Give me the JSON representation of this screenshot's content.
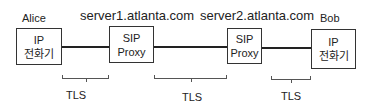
{
  "diagram": {
    "nodes": [
      {
        "id": "alice",
        "caption": "Alice",
        "line1": "IP",
        "line2": "전화기"
      },
      {
        "id": "proxy1",
        "caption": "server1.atlanta.com",
        "line1": "SIP",
        "line2": "Proxy"
      },
      {
        "id": "proxy2",
        "caption": "server2.atlanta.com",
        "line1": "SIP",
        "line2": "Proxy"
      },
      {
        "id": "bob",
        "caption": "Bob",
        "line1": "IP",
        "line2": "전화기"
      }
    ],
    "links": [
      {
        "from": "alice",
        "to": "proxy1",
        "label": "TLS"
      },
      {
        "from": "proxy1",
        "to": "proxy2",
        "label": "TLS"
      },
      {
        "from": "proxy2",
        "to": "bob",
        "label": "TLS"
      }
    ]
  }
}
